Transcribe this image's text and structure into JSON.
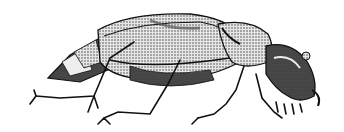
{
  "image": {
    "subject": "beetle illustration",
    "style": "black ink stipple drawing on white",
    "colors": {
      "background": "#ffffff",
      "ink": "#111111",
      "mid": "#555555",
      "light": "#d8d8d8"
    }
  }
}
